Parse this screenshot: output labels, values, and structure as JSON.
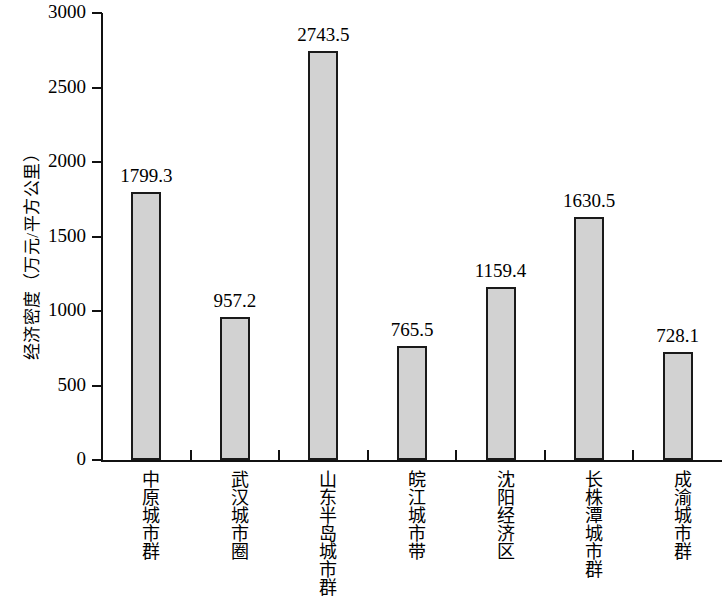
{
  "chart_data": {
    "type": "bar",
    "title": "",
    "xlabel": "",
    "ylabel": "经济密度（万元/平方公里）",
    "ylim": [
      0,
      3000
    ],
    "grid": false,
    "legend": null,
    "y_ticks": [
      "0",
      "500",
      "1000",
      "1500",
      "2000",
      "2500",
      "3000"
    ],
    "y_tick_values": [
      0,
      500,
      1000,
      1500,
      2000,
      2500,
      3000
    ],
    "categories": [
      "中原城市群",
      "武汉城市圈",
      "山东半岛城市群",
      "皖江城市带",
      "沈阳经济区",
      "长株潭城市群",
      "成渝城市群"
    ],
    "values": [
      1799.3,
      957.2,
      2743.5,
      765.5,
      1159.4,
      1630.5,
      728.1
    ],
    "value_labels": [
      "1799.3",
      "957.2",
      "2743.5",
      "765.5",
      "1159.4",
      "1630.5",
      "728.1"
    ],
    "bar_fill_color": "#d2d2d2",
    "bar_edge_color": "#1a1a1a",
    "axis_color": "#111111"
  }
}
